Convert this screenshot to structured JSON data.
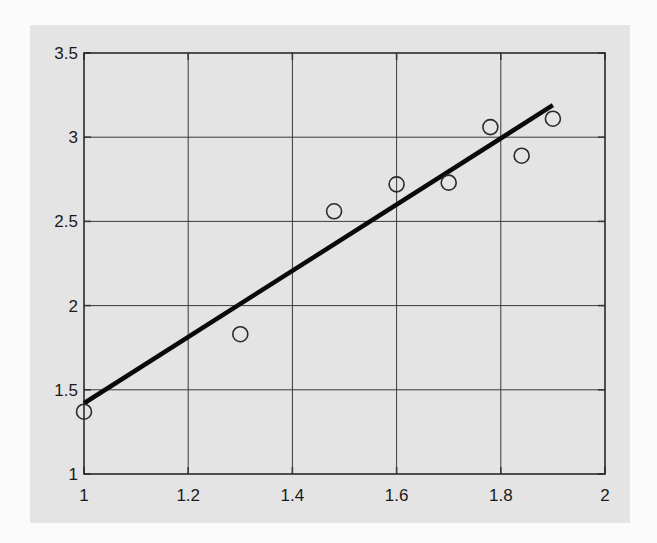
{
  "chart_data": {
    "type": "scatter",
    "title": "",
    "xlabel": "",
    "ylabel": "",
    "xlim": [
      1,
      2
    ],
    "ylim": [
      1,
      3.5
    ],
    "grid": true,
    "legend": null,
    "x_ticks": [
      "1",
      "1.2",
      "1.4",
      "1.6",
      "1.8",
      "2"
    ],
    "y_ticks": [
      "1",
      "1.5",
      "2",
      "2.5",
      "3",
      "3.5"
    ],
    "series": [
      {
        "name": "data points",
        "marker": "open-circle",
        "x": [
          1.0,
          1.3,
          1.48,
          1.6,
          1.7,
          1.78,
          1.84,
          1.9
        ],
        "y": [
          1.37,
          1.83,
          2.56,
          2.72,
          2.73,
          3.06,
          2.89,
          3.11
        ]
      },
      {
        "name": "fitted line",
        "style": "line",
        "x": [
          1.0,
          1.9
        ],
        "y": [
          1.42,
          3.19
        ]
      }
    ],
    "colors": {
      "panel_background": "#e4e4e4",
      "page_background": "#fbfbfb",
      "grid": "#3a3a3a",
      "line": "#0a0a0a",
      "marker": "#2a2a2a"
    }
  }
}
